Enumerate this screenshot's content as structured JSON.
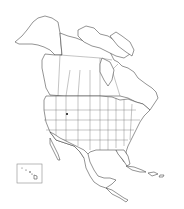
{
  "map": {
    "type": "blank outline map",
    "region": "North America",
    "colors": {
      "background": "#ffffff",
      "outline": "#3a3a3a",
      "borders": "#6a6a6a"
    },
    "insets": [
      {
        "name": "Hawaii",
        "label": ""
      }
    ],
    "markers": [
      {
        "name": "marker-point",
        "approx_x": 67,
        "approx_y": 114
      }
    ]
  }
}
